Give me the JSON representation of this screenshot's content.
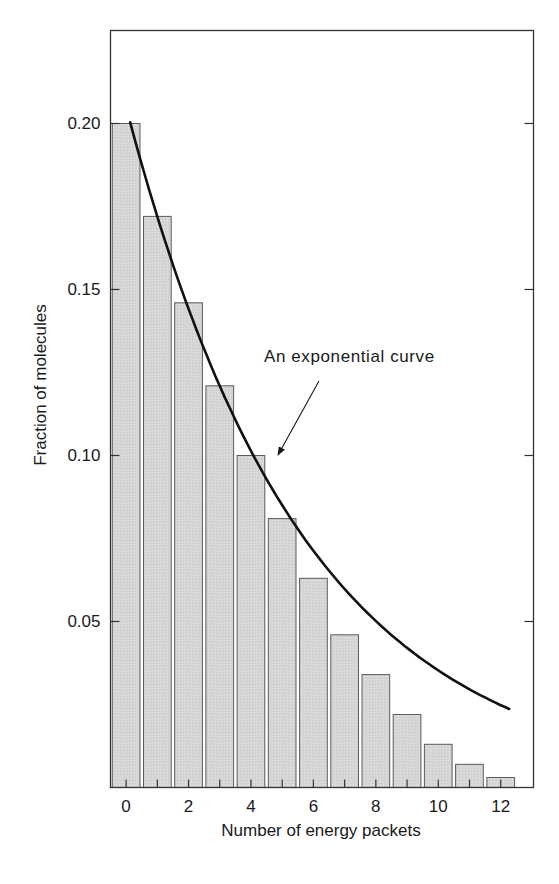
{
  "chart_data": {
    "type": "bar",
    "title": "",
    "xlabel": "Number of energy packets",
    "ylabel": "Fraction of molecules",
    "categories": [
      0,
      1,
      2,
      3,
      4,
      5,
      6,
      7,
      8,
      9,
      10,
      11,
      12
    ],
    "values": [
      0.2,
      0.172,
      0.146,
      0.121,
      0.1,
      0.081,
      0.063,
      0.046,
      0.034,
      0.022,
      0.013,
      0.007,
      0.003
    ],
    "xlim": [
      -0.5,
      13.05
    ],
    "ylim": [
      0,
      0.228
    ],
    "x_ticks": [
      0,
      2,
      4,
      6,
      8,
      10,
      12
    ],
    "x_tick_labels": [
      "0",
      "2",
      "4",
      "6",
      "8",
      "10",
      "12"
    ],
    "y_ticks": [
      0.05,
      0.1,
      0.15,
      0.2
    ],
    "y_tick_labels": [
      "0.05",
      "0.10",
      "0.15",
      "0.20"
    ],
    "grid": false,
    "legend": null,
    "overlay_curve": {
      "type": "line",
      "label": "An exponential curve",
      "formula": "y = 0.205 * exp(-0.176 * x)",
      "x_range": [
        0.13,
        12.27
      ],
      "points": [
        {
          "x": 0.13,
          "y": 0.204
        },
        {
          "x": 1,
          "y": 0.172
        },
        {
          "x": 2,
          "y": 0.144
        },
        {
          "x": 3,
          "y": 0.121
        },
        {
          "x": 4,
          "y": 0.101
        },
        {
          "x": 5,
          "y": 0.085
        },
        {
          "x": 6,
          "y": 0.071
        },
        {
          "x": 7,
          "y": 0.06
        },
        {
          "x": 8,
          "y": 0.05
        },
        {
          "x": 9,
          "y": 0.042
        },
        {
          "x": 10,
          "y": 0.035
        },
        {
          "x": 11,
          "y": 0.03
        },
        {
          "x": 12.27,
          "y": 0.024
        }
      ]
    },
    "annotations": [
      {
        "text": "An exponential curve",
        "arrow_to": {
          "x": 4.85,
          "y": 0.091
        }
      }
    ],
    "colors": {
      "bar_fill": "#d4d4d4",
      "bar_stroke": "#5a5a5a",
      "curve": "#111111",
      "axis": "#333333",
      "text": "#1a1a1a",
      "background": "#ffffff"
    }
  }
}
